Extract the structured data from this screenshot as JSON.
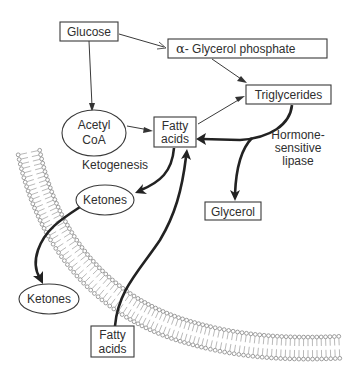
{
  "diagram": {
    "nodes": {
      "glucose": "Glucose",
      "alpha_glycerol_phosphate_symbol": "α",
      "alpha_glycerol_phosphate": "- Glycerol phosphate",
      "triglycerides": "Triglycerides",
      "acetyl_coa_line1": "Acetyl",
      "acetyl_coa_line2": "CoA",
      "fatty_acids_upper_line1": "Fatty",
      "fatty_acids_upper_line2": "acids",
      "ketones_inner": "Ketones",
      "glycerol": "Glycerol",
      "ketones_outer": "Ketones",
      "fatty_acids_lower_line1": "Fatty",
      "fatty_acids_lower_line2": "acids"
    },
    "labels": {
      "ketogenesis": "Ketogenesis",
      "lipase_line1": "Hormone-",
      "lipase_line2": "sensitive",
      "lipase_line3": "lipase"
    },
    "edges": [
      {
        "from": "Glucose",
        "to": "α-Glycerol phosphate",
        "style": "thin"
      },
      {
        "from": "Glucose",
        "to": "Acetyl CoA",
        "style": "thin"
      },
      {
        "from": "α-Glycerol phosphate",
        "to": "Triglycerides",
        "style": "thin"
      },
      {
        "from": "Acetyl CoA",
        "to": "Fatty acids",
        "style": "thin"
      },
      {
        "from": "Fatty acids",
        "to": "Triglycerides",
        "style": "thin"
      },
      {
        "from": "Triglycerides",
        "to": "Fatty acids",
        "style": "thick",
        "label": "Hormone-sensitive lipase"
      },
      {
        "from": "Triglycerides",
        "to": "Glycerol",
        "style": "thick"
      },
      {
        "from": "Fatty acids",
        "to": "Ketones",
        "style": "thick",
        "label": "Ketogenesis"
      },
      {
        "from": "Ketones",
        "to": "Ketones (outside cell)",
        "style": "thick",
        "crosses": "cell membrane"
      },
      {
        "from": "Fatty acids (outside cell)",
        "to": "Fatty acids",
        "style": "thick",
        "crosses": "cell membrane"
      }
    ],
    "structures": {
      "membrane": "lipid-bilayer"
    }
  }
}
